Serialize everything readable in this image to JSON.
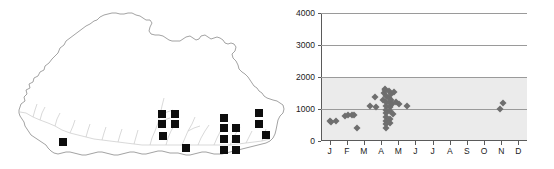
{
  "figure": {
    "panels": [
      "distribution-map",
      "altitude-month-scatter"
    ],
    "background_color": "#ffffff"
  },
  "map": {
    "title": "",
    "region_name": "Bhutan",
    "outline_color": "#8c8c8c",
    "river_color": "#c4c4c4",
    "marker_color": "#0d0d0d",
    "marker_shape": "square",
    "marker_count": 17,
    "markers": [
      {
        "x": 63,
        "y": 142
      },
      {
        "x": 162,
        "y": 114
      },
      {
        "x": 175,
        "y": 114
      },
      {
        "x": 162,
        "y": 124
      },
      {
        "x": 175,
        "y": 124
      },
      {
        "x": 163,
        "y": 136
      },
      {
        "x": 186,
        "y": 148
      },
      {
        "x": 224,
        "y": 128
      },
      {
        "x": 224,
        "y": 139
      },
      {
        "x": 236,
        "y": 139
      },
      {
        "x": 224,
        "y": 150
      },
      {
        "x": 236,
        "y": 150
      },
      {
        "x": 224,
        "y": 118
      },
      {
        "x": 259,
        "y": 113
      },
      {
        "x": 259,
        "y": 124
      },
      {
        "x": 266,
        "y": 135
      },
      {
        "x": 236,
        "y": 128
      }
    ]
  },
  "chart_data": {
    "type": "scatter",
    "title": "",
    "xlabel": "",
    "ylabel": "",
    "grid": true,
    "legend": null,
    "point_color": "#6e6e6e",
    "point_shape": "diamond",
    "plot_background": "#ffffff",
    "shaded_band_color": "#ebebeb",
    "shaded_band_range": [
      0,
      2000
    ],
    "x_categories": [
      "J",
      "F",
      "M",
      "A",
      "M",
      "J",
      "J",
      "A",
      "S",
      "O",
      "N",
      "D"
    ],
    "x_category_names": [
      "January",
      "February",
      "March",
      "April",
      "May",
      "June",
      "July",
      "August",
      "September",
      "October",
      "November",
      "December"
    ],
    "xlim": [
      0.5,
      12.5
    ],
    "ylim": [
      0,
      4000
    ],
    "ytick_labels": [
      "0",
      "1000",
      "2000",
      "3000",
      "4000"
    ],
    "ytick_values": [
      0,
      1000,
      2000,
      3000,
      4000
    ],
    "points": [
      {
        "month": 1,
        "altitude": 620
      },
      {
        "month": 1.1,
        "altitude": 600
      },
      {
        "month": 1.35,
        "altitude": 640
      },
      {
        "month": 1.9,
        "altitude": 790
      },
      {
        "month": 2.05,
        "altitude": 800
      },
      {
        "month": 2.3,
        "altitude": 810
      },
      {
        "month": 2.45,
        "altitude": 800
      },
      {
        "month": 2.6,
        "altitude": 420
      },
      {
        "month": 3.35,
        "altitude": 1100
      },
      {
        "month": 3.65,
        "altitude": 1360
      },
      {
        "month": 3.7,
        "altitude": 1060
      },
      {
        "month": 4.1,
        "altitude": 1280
      },
      {
        "month": 4.15,
        "altitude": 1500
      },
      {
        "month": 4.2,
        "altitude": 1600
      },
      {
        "month": 4.25,
        "altitude": 1640
      },
      {
        "month": 4.3,
        "altitude": 1420
      },
      {
        "month": 4.3,
        "altitude": 1230
      },
      {
        "month": 4.3,
        "altitude": 1100
      },
      {
        "month": 4.3,
        "altitude": 980
      },
      {
        "month": 4.3,
        "altitude": 880
      },
      {
        "month": 4.3,
        "altitude": 760
      },
      {
        "month": 4.3,
        "altitude": 640
      },
      {
        "month": 4.3,
        "altitude": 520
      },
      {
        "month": 4.3,
        "altitude": 400
      },
      {
        "month": 4.45,
        "altitude": 1560
      },
      {
        "month": 4.45,
        "altitude": 1350
      },
      {
        "month": 4.5,
        "altitude": 1180
      },
      {
        "month": 4.5,
        "altitude": 1060
      },
      {
        "month": 4.5,
        "altitude": 930
      },
      {
        "month": 4.5,
        "altitude": 700
      },
      {
        "month": 4.5,
        "altitude": 560
      },
      {
        "month": 4.6,
        "altitude": 1460
      },
      {
        "month": 4.6,
        "altitude": 1290
      },
      {
        "month": 4.65,
        "altitude": 1150
      },
      {
        "month": 4.7,
        "altitude": 830
      },
      {
        "month": 4.75,
        "altitude": 1520
      },
      {
        "month": 4.85,
        "altitude": 1230
      },
      {
        "month": 5.05,
        "altitude": 1150
      },
      {
        "month": 5.5,
        "altitude": 1080
      },
      {
        "month": 10.9,
        "altitude": 1000
      },
      {
        "month": 11.1,
        "altitude": 1200
      }
    ]
  }
}
